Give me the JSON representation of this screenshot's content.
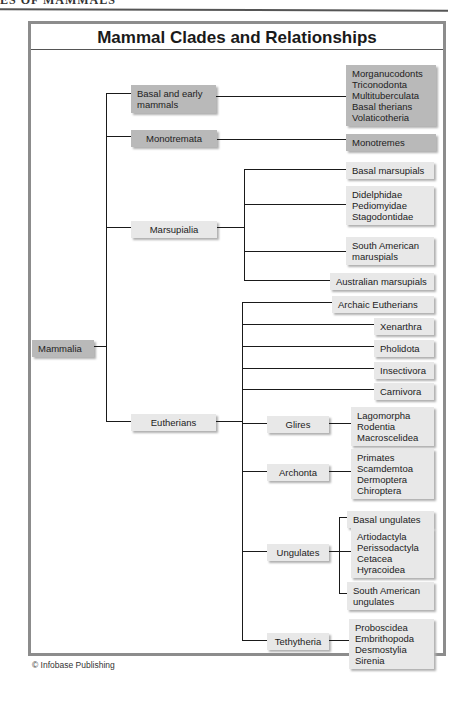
{
  "running_head": "ES OF MAMMALS",
  "title": "Mammal Clades and Relationships",
  "root": "Mammalia",
  "clades": {
    "basal": {
      "label": "Basal and early mammals",
      "line1": "Basal and early",
      "line2": "mammals",
      "members": [
        "Morganucodonts",
        "Triconodonta",
        "Multituberculata",
        "Basal therians",
        "Volaticotheria"
      ]
    },
    "monotremata": {
      "label": "Monotremata",
      "members": [
        "Monotremes"
      ]
    },
    "marsupialia": {
      "label": "Marsupialia",
      "groups": [
        {
          "label": "Basal marsupials"
        },
        {
          "members": [
            "Didelphidae",
            "Pediomyidae",
            "Stagodontidae"
          ]
        },
        {
          "line1": "South American",
          "line2": "maruspials"
        },
        {
          "label": "Australian marsupials"
        }
      ]
    },
    "eutherians": {
      "label": "Eutherians",
      "direct": [
        "Archaic Eutherians",
        "Xenarthra",
        "Pholidota",
        "Insectivora",
        "Carnivora"
      ],
      "glires": {
        "label": "Glires",
        "members": [
          "Lagomorpha",
          "Rodentia",
          "Macroscelidea"
        ]
      },
      "archonta": {
        "label": "Archonta",
        "members": [
          "Primates",
          "Scamdemtoa",
          "Dermoptera",
          "Chiroptera"
        ]
      },
      "ungulates": {
        "label": "Ungulates",
        "basal": "Basal ungulates",
        "members": [
          "Artiodactyla",
          "Perissodactyla",
          "Cetacea",
          "Hyracoidea"
        ],
        "sa_line1": "South American",
        "sa_line2": "ungulates"
      },
      "tethytheria": {
        "label": "Tethytheria",
        "members": [
          "Proboscidea",
          "Embrithopoda",
          "Desmostylia",
          "Sirenia"
        ]
      }
    }
  },
  "credit": "© Infobase Publishing",
  "colors": {
    "frame": "#8c8c8c",
    "box_light": "#e8e8e8",
    "box_dark": "#b9b9b9",
    "line": "#1a1a1a"
  }
}
